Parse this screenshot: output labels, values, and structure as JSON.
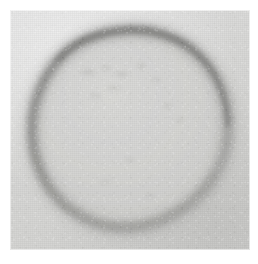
{
  "image": {
    "kind": "micrograph",
    "modality": "light-microscopy",
    "caption": "",
    "frame": {
      "x": 10,
      "y": 10,
      "width": 240,
      "height": 240
    },
    "page_background_color": "#ffffff"
  },
  "palette": {
    "page": "#ffffff",
    "background_outside": "#dcdcda",
    "background_outside_light": "#e6e6e4",
    "vesicle_interior": "#d3d3d1",
    "membrane_ring_dark": "#8e8e8c",
    "membrane_ring_mid": "#a8a8a6",
    "membrane_ring_soft": "#c0c0be",
    "speckle_dark": "#b2b2b0"
  },
  "object": {
    "name": "vesicle",
    "label": "",
    "shape": "near-circular, slightly irregular",
    "center_x": 130,
    "center_y": 128,
    "radius_x": 92,
    "radius_y": 100,
    "membrane_thickness_px": 10,
    "interior_uniform": true
  },
  "annotations": {
    "scale_bar": "",
    "scale_bar_visible": false,
    "labels": [],
    "arrows": [],
    "text_overlays": []
  },
  "chart_data": {
    "type": "heatmap",
    "title": "",
    "xlabel": "",
    "ylabel": ""
  }
}
